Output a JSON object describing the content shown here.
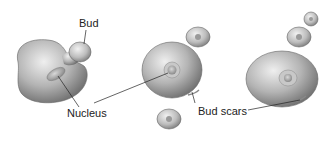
{
  "diagram": {
    "labels": {
      "bud": "Bud",
      "nucleus": "Nucleus",
      "bud_scars": "Bud scars"
    },
    "cells": [
      {
        "name": "mother-cell-with-bud",
        "position": "left"
      },
      {
        "name": "mother-cell-with-released-daughter",
        "position": "center"
      },
      {
        "name": "mother-cell-with-bud-chain",
        "position": "right"
      }
    ],
    "colors": {
      "cell_fill": "#a8a8a8",
      "cell_highlight": "#e6e6e6",
      "cell_shadow": "#6f6f6f",
      "leader_line": "#222222",
      "background": "#ffffff"
    }
  }
}
